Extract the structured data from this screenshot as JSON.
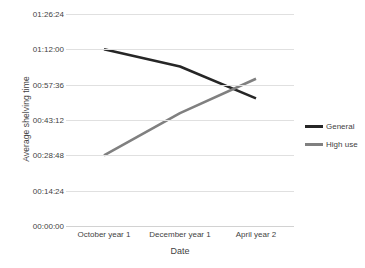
{
  "chart_data": {
    "type": "line",
    "title": "",
    "xlabel": "Date",
    "ylabel": "Average shelving time",
    "categories": [
      "October year 1",
      "December year 1",
      "April year 2"
    ],
    "yticks": [
      "00:00:00",
      "00:14:24",
      "00:28:48",
      "00:43:12",
      "00:57:36",
      "01:12:00",
      "01:26:24"
    ],
    "ylim": [
      "00:00:00",
      "01:26:24"
    ],
    "grid": "horizontal",
    "legend_position": "right",
    "series": [
      {
        "name": "General",
        "color": "#262626",
        "values": [
          "01:12:00",
          "01:05:00",
          "00:52:00"
        ],
        "values_seconds": [
          4320,
          3900,
          3120
        ]
      },
      {
        "name": "High use",
        "color": "#808080",
        "values": [
          "00:28:48",
          "00:46:00",
          "01:00:00"
        ],
        "values_seconds": [
          1728,
          2760,
          3600
        ]
      }
    ]
  },
  "legend": {
    "items": [
      {
        "label": "General",
        "color": "#262626"
      },
      {
        "label": "High use",
        "color": "#808080"
      }
    ]
  }
}
